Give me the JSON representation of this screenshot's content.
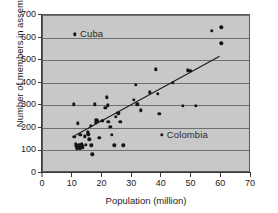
{
  "chart_data": {
    "type": "scatter",
    "title": "",
    "xlabel": "Population (million)",
    "ylabel": "Number of members in assembly",
    "xlim": [
      0,
      70
    ],
    "ylim": [
      0,
      700
    ],
    "xticks": [
      0,
      10,
      20,
      30,
      40,
      50,
      60,
      70
    ],
    "yticks": [
      0,
      100,
      200,
      300,
      400,
      500,
      600,
      700
    ],
    "grid": "horizontal",
    "legend": "none",
    "points": [
      [
        10.3,
        305
      ],
      [
        10.6,
        160
      ],
      [
        10.8,
        615
      ],
      [
        11.0,
        130
      ],
      [
        11.2,
        120
      ],
      [
        11.4,
        110
      ],
      [
        11.6,
        118
      ],
      [
        11.8,
        220
      ],
      [
        12.0,
        125
      ],
      [
        12.2,
        113
      ],
      [
        12.3,
        108
      ],
      [
        12.5,
        122
      ],
      [
        12.6,
        168
      ],
      [
        12.8,
        115
      ],
      [
        13.0,
        128
      ],
      [
        13.2,
        112
      ],
      [
        13.4,
        118
      ],
      [
        14.0,
        163
      ],
      [
        14.4,
        125
      ],
      [
        15.0,
        180
      ],
      [
        15.3,
        172
      ],
      [
        15.6,
        150
      ],
      [
        16.0,
        210
      ],
      [
        16.3,
        122
      ],
      [
        16.6,
        83
      ],
      [
        17.5,
        305
      ],
      [
        17.8,
        225
      ],
      [
        18.0,
        235
      ],
      [
        18.4,
        230
      ],
      [
        19.0,
        155
      ],
      [
        20.0,
        230
      ],
      [
        21.0,
        290
      ],
      [
        21.4,
        335
      ],
      [
        21.8,
        300
      ],
      [
        22.0,
        228
      ],
      [
        22.6,
        205
      ],
      [
        23.2,
        170
      ],
      [
        24.0,
        122
      ],
      [
        24.6,
        250
      ],
      [
        25.4,
        265
      ],
      [
        26.0,
        228
      ],
      [
        27.0,
        122
      ],
      [
        30.5,
        325
      ],
      [
        31.3,
        390
      ],
      [
        31.8,
        305
      ],
      [
        33.0,
        278
      ],
      [
        36.0,
        358
      ],
      [
        38.0,
        460
      ],
      [
        38.6,
        352
      ],
      [
        39.2,
        262
      ],
      [
        40.0,
        168
      ],
      [
        43.6,
        400
      ],
      [
        47.0,
        297
      ],
      [
        48.8,
        455
      ],
      [
        49.6,
        452
      ],
      [
        51.4,
        298
      ],
      [
        56.8,
        630
      ],
      [
        60.0,
        645
      ],
      [
        60.0,
        575
      ]
    ],
    "trendline": {
      "x1": 11.0,
      "y1": 160,
      "x2": 60.0,
      "y2": 515
    },
    "annotations": [
      {
        "label": "Cuba",
        "x": 10.8,
        "y": 615
      },
      {
        "label": "Colombia",
        "x": 40.0,
        "y": 168
      }
    ],
    "colors": {
      "plot_background": "#c8c8c8",
      "point": "#151515",
      "gridline": "#6e6e6e",
      "axis": "#3a3a3a",
      "text": "#1b1b1b"
    }
  }
}
